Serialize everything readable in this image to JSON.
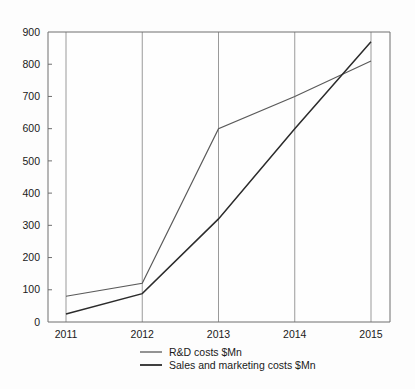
{
  "chart_data": {
    "type": "line",
    "title": "",
    "subtitle": "",
    "xlabel": "",
    "ylabel": "",
    "categories": [
      "2011",
      "2012",
      "2013",
      "2014",
      "2015"
    ],
    "ylim": [
      0,
      900
    ],
    "yticks": [
      0,
      100,
      200,
      300,
      400,
      500,
      600,
      700,
      800,
      900
    ],
    "ytick_labels": [
      "0",
      "100",
      "200",
      "300",
      "400",
      "500",
      "600",
      "700",
      "800",
      "900"
    ],
    "grid": "vertical-only",
    "legend_position": "bottom-center",
    "series": [
      {
        "name": "R&D costs $Mn",
        "values": [
          80,
          120,
          600,
          700,
          810
        ],
        "color": "#5a5a5a"
      },
      {
        "name": "Sales and marketing costs $Mn",
        "values": [
          25,
          88,
          320,
          600,
          870
        ],
        "color": "#2b2b2b"
      }
    ],
    "colors": {
      "background": "#fdfdfd",
      "plot_background": "#fefefe",
      "axis": "#6f6f6f",
      "gridline": "#9a9a9a",
      "text": "#1a1a1a"
    }
  },
  "legend": {
    "items": [
      {
        "label": "R&D costs $Mn"
      },
      {
        "label": "Sales and marketing costs $Mn"
      }
    ]
  }
}
